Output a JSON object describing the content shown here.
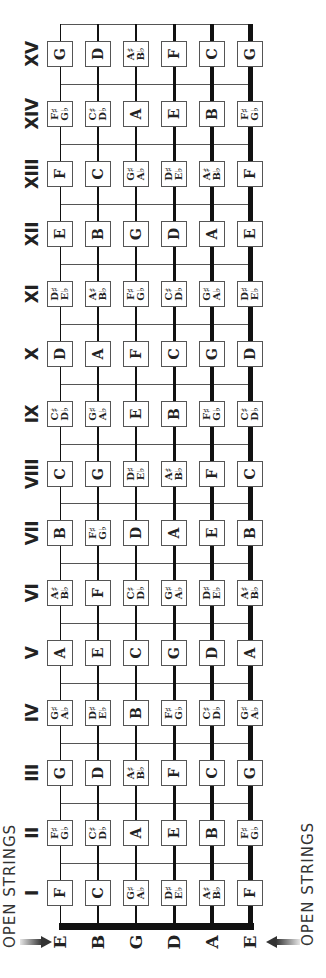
{
  "open_strings_caption_left": "OPEN STRINGS",
  "open_strings_caption_right": "OPEN STRINGS",
  "open_strings": [
    "E",
    "B",
    "G",
    "D",
    "A",
    "E"
  ],
  "frets": [
    {
      "numeral": "I",
      "notes": [
        [
          "F"
        ],
        [
          "C"
        ],
        [
          "G♯",
          "A♭"
        ],
        [
          "D♯",
          "E♭"
        ],
        [
          "A♯",
          "B♭"
        ],
        [
          "F"
        ]
      ]
    },
    {
      "numeral": "II",
      "notes": [
        [
          "F♯",
          "G♭"
        ],
        [
          "C♯",
          "D♭"
        ],
        [
          "A"
        ],
        [
          "E"
        ],
        [
          "B"
        ],
        [
          "F♯",
          "G♭"
        ]
      ]
    },
    {
      "numeral": "III",
      "notes": [
        [
          "G"
        ],
        [
          "D"
        ],
        [
          "A♯",
          "B♭"
        ],
        [
          "F"
        ],
        [
          "C"
        ],
        [
          "G"
        ]
      ]
    },
    {
      "numeral": "IV",
      "notes": [
        [
          "G♯",
          "A♭"
        ],
        [
          "D♯",
          "E♭"
        ],
        [
          "B"
        ],
        [
          "F♯",
          "G♭"
        ],
        [
          "C♯",
          "D♭"
        ],
        [
          "G♯",
          "A♭"
        ]
      ]
    },
    {
      "numeral": "V",
      "notes": [
        [
          "A"
        ],
        [
          "E"
        ],
        [
          "C"
        ],
        [
          "G"
        ],
        [
          "D"
        ],
        [
          "A"
        ]
      ]
    },
    {
      "numeral": "VI",
      "notes": [
        [
          "A♯",
          "B♭"
        ],
        [
          "F"
        ],
        [
          "C♯",
          "D♭"
        ],
        [
          "G♯",
          "A♭"
        ],
        [
          "D♯",
          "E♭"
        ],
        [
          "A♯",
          "B♭"
        ]
      ]
    },
    {
      "numeral": "VII",
      "notes": [
        [
          "B"
        ],
        [
          "F♯",
          "G♭"
        ],
        [
          "D"
        ],
        [
          "A"
        ],
        [
          "E"
        ],
        [
          "B"
        ]
      ]
    },
    {
      "numeral": "VIII",
      "notes": [
        [
          "C"
        ],
        [
          "G"
        ],
        [
          "D♯",
          "E♭"
        ],
        [
          "A♯",
          "B♭"
        ],
        [
          "F"
        ],
        [
          "C"
        ]
      ]
    },
    {
      "numeral": "IX",
      "notes": [
        [
          "C♯",
          "D♭"
        ],
        [
          "G♯",
          "A♭"
        ],
        [
          "E"
        ],
        [
          "B"
        ],
        [
          "F♯",
          "G♭"
        ],
        [
          "C♯",
          "D♭"
        ]
      ]
    },
    {
      "numeral": "X",
      "notes": [
        [
          "D"
        ],
        [
          "A"
        ],
        [
          "F"
        ],
        [
          "C"
        ],
        [
          "G"
        ],
        [
          "D"
        ]
      ]
    },
    {
      "numeral": "XI",
      "notes": [
        [
          "D♯",
          "E♭"
        ],
        [
          "A♯",
          "B♭"
        ],
        [
          "F♯",
          "G♭"
        ],
        [
          "C♯",
          "D♭"
        ],
        [
          "G♯",
          "A♭"
        ],
        [
          "D♯",
          "E♭"
        ]
      ]
    },
    {
      "numeral": "XII",
      "notes": [
        [
          "E"
        ],
        [
          "B"
        ],
        [
          "G"
        ],
        [
          "D"
        ],
        [
          "A"
        ],
        [
          "E"
        ]
      ]
    },
    {
      "numeral": "XIII",
      "notes": [
        [
          "F"
        ],
        [
          "C"
        ],
        [
          "G♯",
          "A♭"
        ],
        [
          "D♯",
          "E♭"
        ],
        [
          "A♯",
          "B♭"
        ],
        [
          "F"
        ]
      ]
    },
    {
      "numeral": "XIV",
      "notes": [
        [
          "F♯",
          "G♭"
        ],
        [
          "C♯",
          "D♭"
        ],
        [
          "A"
        ],
        [
          "E"
        ],
        [
          "B"
        ],
        [
          "F♯",
          "G♭"
        ]
      ]
    },
    {
      "numeral": "XV",
      "notes": [
        [
          "G"
        ],
        [
          "D"
        ],
        [
          "A♯",
          "B♭"
        ],
        [
          "F"
        ],
        [
          "C"
        ],
        [
          "G"
        ]
      ]
    }
  ],
  "colors": {
    "string": "#111111",
    "fret_line": "#555555",
    "box_border": "#555555",
    "text": "#222222"
  }
}
